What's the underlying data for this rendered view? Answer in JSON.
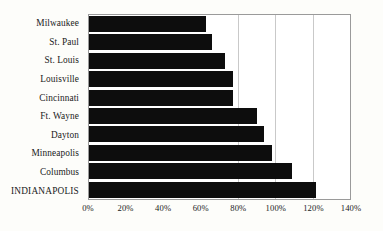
{
  "chart_data": {
    "type": "bar",
    "orientation": "horizontal",
    "title": "",
    "subtitle": "",
    "xlabel": "",
    "ylabel": "",
    "categories": [
      "Milwaukee",
      "St. Paul",
      "St. Louis",
      "Louisville",
      "Cincinnati",
      "Ft. Wayne",
      "Dayton",
      "Minneapolis",
      "Columbus",
      "INDIANAPOLIS"
    ],
    "values": [
      63,
      66,
      73,
      77,
      77,
      90,
      94,
      98,
      109,
      122
    ],
    "value_suffix": "%",
    "xlim": [
      0,
      140
    ],
    "xticks": [
      0,
      20,
      40,
      60,
      80,
      100,
      120,
      140
    ],
    "xtick_labels": [
      "0%",
      "20%",
      "40%",
      "60%",
      "80%",
      "100%",
      "120%",
      "140%"
    ],
    "gridlines_at": [
      80,
      100,
      120
    ],
    "grid": true,
    "legend": false,
    "legend_position": "none",
    "bar_color": "#0d0d0d",
    "grid_color": "#c9c9c9",
    "axis_color": "#9a9a9a",
    "background_color": "#fdfdfa",
    "emphasized_category": "INDIANAPOLIS"
  }
}
